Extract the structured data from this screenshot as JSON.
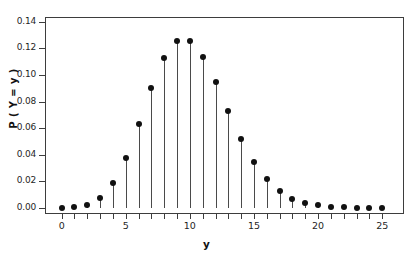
{
  "chart_data": {
    "type": "scatter",
    "plot_style": "stem",
    "title": "",
    "subtitle": "",
    "xlabel": "y",
    "ylabel": "P ( Y = y )",
    "x": [
      0,
      1,
      2,
      3,
      4,
      5,
      6,
      7,
      8,
      9,
      10,
      11,
      12,
      13,
      14,
      15,
      16,
      17,
      18,
      19,
      20,
      21,
      22,
      23,
      24,
      25
    ],
    "values": [
      0.0,
      0.0005,
      0.0023,
      0.0076,
      0.0189,
      0.0378,
      0.0631,
      0.0901,
      0.1126,
      0.1251,
      0.1251,
      0.1137,
      0.0948,
      0.0729,
      0.0521,
      0.0347,
      0.0217,
      0.0128,
      0.0071,
      0.0037,
      0.0019,
      0.0009,
      0.0004,
      0.0002,
      0.0001,
      0.0
    ],
    "series": [
      {
        "name": "P ( Y = y )",
        "values": [
          0.0,
          0.0005,
          0.0023,
          0.0076,
          0.0189,
          0.0378,
          0.0631,
          0.0901,
          0.1126,
          0.1251,
          0.1251,
          0.1137,
          0.0948,
          0.0729,
          0.0521,
          0.0347,
          0.0217,
          0.0128,
          0.0071,
          0.0037,
          0.0019,
          0.0009,
          0.0004,
          0.0002,
          0.0001,
          0.0
        ]
      }
    ],
    "xlim": [
      -1.3,
      26.7
    ],
    "ylim": [
      -0.0045,
      0.1435
    ],
    "xticks": [
      0,
      5,
      10,
      15,
      20,
      25
    ],
    "xtick_labels": [
      "0",
      "5",
      "10",
      "15",
      "20",
      "25"
    ],
    "xminor_ticks": [
      0,
      1,
      2,
      3,
      4,
      5,
      6,
      7,
      8,
      9,
      10,
      11,
      12,
      13,
      14,
      15,
      16,
      17,
      18,
      19,
      20,
      21,
      22,
      23,
      24,
      25
    ],
    "yticks": [
      0.0,
      0.02,
      0.04,
      0.06,
      0.08,
      0.1,
      0.12,
      0.14
    ],
    "ytick_labels": [
      "0.00",
      "0.02",
      "0.04",
      "0.06",
      "0.08",
      "0.10",
      "0.12",
      "0.14"
    ],
    "grid": false,
    "legend": null,
    "legend_position": "none",
    "marker_color": "#111111",
    "stem_color": "#4a4a4a",
    "axis_color": "#3d3d3d",
    "background_color": "#ffffff",
    "annotations": []
  }
}
